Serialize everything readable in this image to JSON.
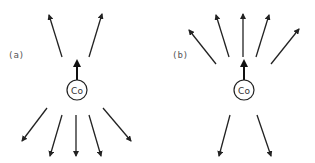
{
  "diagram": {
    "panels": [
      {
        "id": "a",
        "label": "(a)",
        "atom_label": "Co",
        "center_arrow": "up",
        "upper_arrow_count": 2,
        "lower_arrow_count": 5
      },
      {
        "id": "b",
        "label": "(b)",
        "atom_label": "Co",
        "center_arrow": "up",
        "upper_arrow_count": 5,
        "lower_arrow_count": 2
      }
    ],
    "colors": {
      "stroke": "#222222",
      "label": "#555555",
      "background": "#ffffff"
    }
  }
}
